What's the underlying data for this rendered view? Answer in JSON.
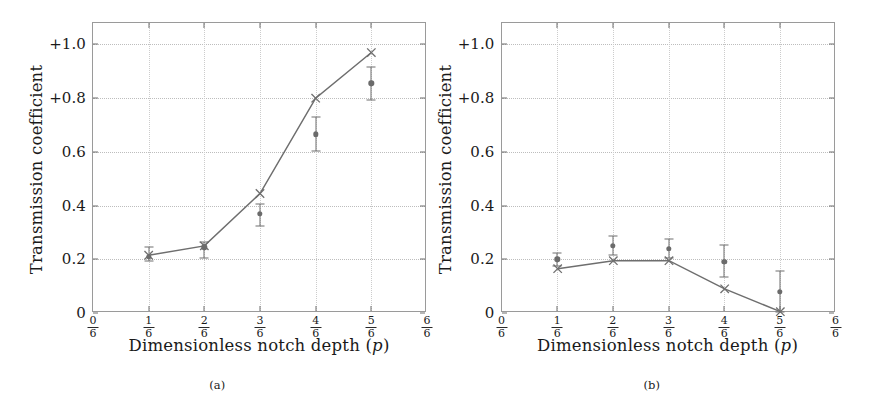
{
  "figure": {
    "panels": [
      {
        "caption": "(a)",
        "ylabel": "Transmission coefficient",
        "xlabel_text": "Dimensionless notch depth",
        "xlabel_symbol": "(p)",
        "yticks": [
          "0",
          "0.2",
          "0.4",
          "0.6",
          "+0.8",
          "+1.0"
        ],
        "ytick_values": [
          0,
          0.2,
          0.4,
          0.6,
          0.8,
          1.0
        ],
        "xticks": [
          {
            "num": "0",
            "den": "6"
          },
          {
            "num": "1",
            "den": "6"
          },
          {
            "num": "2",
            "den": "6"
          },
          {
            "num": "3",
            "den": "6"
          },
          {
            "num": "4",
            "den": "6"
          },
          {
            "num": "5",
            "den": "6"
          },
          {
            "num": "6",
            "den": "6"
          }
        ]
      },
      {
        "caption": "(b)",
        "ylabel": "Transmission coefficient",
        "xlabel_text": "Dimensionless notch depth",
        "xlabel_symbol": "(p)",
        "yticks": [
          "0",
          "0.2",
          "0.4",
          "0.6",
          "+0.8",
          "+1.0"
        ],
        "ytick_values": [
          0,
          0.2,
          0.4,
          0.6,
          0.8,
          1.0
        ],
        "xticks": [
          {
            "num": "0",
            "den": "6"
          },
          {
            "num": "1",
            "den": "6"
          },
          {
            "num": "2",
            "den": "6"
          },
          {
            "num": "3",
            "den": "6"
          },
          {
            "num": "4",
            "den": "6"
          },
          {
            "num": "5",
            "den": "6"
          },
          {
            "num": "6",
            "den": "6"
          }
        ]
      }
    ]
  },
  "style": {
    "line_color": "#6e6e6e",
    "marker_color": "#6b6b6b",
    "axis_color": "#9a9a9a",
    "grid_color": "#bdbdbd",
    "text_color": "#1a1a1a"
  },
  "chart_data": [
    {
      "type": "line",
      "panel": "(a)",
      "title": "",
      "xlabel": "Dimensionless notch depth (p)",
      "ylabel": "Transmission coefficient",
      "xlim": [
        0,
        1
      ],
      "ylim": [
        0,
        1.08
      ],
      "grid": true,
      "legend": "none",
      "xtick_labels": [
        "0/6",
        "1/6",
        "2/6",
        "3/6",
        "4/6",
        "5/6",
        "6/6"
      ],
      "xtick_values": [
        0,
        0.16667,
        0.33333,
        0.5,
        0.66667,
        0.83333,
        1
      ],
      "ytick_labels": [
        "0",
        "0.2",
        "0.4",
        "0.6",
        "+0.8",
        "+1.0"
      ],
      "ytick_values": [
        0,
        0.2,
        0.4,
        0.6,
        0.8,
        1.0
      ],
      "x": [
        0.16667,
        0.33333,
        0.5,
        0.66667,
        0.83333
      ],
      "series": [
        {
          "name": "theory",
          "marker": "x",
          "values": [
            0.215,
            0.25,
            0.445,
            0.8,
            0.97
          ]
        },
        {
          "name": "experiment",
          "marker": "dot",
          "values": [
            0.21,
            0.245,
            0.37,
            0.665,
            0.855
          ],
          "err_low": [
            0.195,
            0.205,
            0.325,
            0.605,
            0.795
          ],
          "err_high": [
            0.245,
            0.265,
            0.405,
            0.73,
            0.915
          ]
        }
      ]
    },
    {
      "type": "line",
      "panel": "(b)",
      "title": "",
      "xlabel": "Dimensionless notch depth (p)",
      "ylabel": "Transmission coefficient",
      "xlim": [
        0,
        1
      ],
      "ylim": [
        0,
        1.08
      ],
      "grid": true,
      "legend": "none",
      "xtick_labels": [
        "0/6",
        "1/6",
        "2/6",
        "3/6",
        "4/6",
        "5/6",
        "6/6"
      ],
      "xtick_values": [
        0,
        0.16667,
        0.33333,
        0.5,
        0.66667,
        0.83333,
        1
      ],
      "ytick_labels": [
        "0",
        "0.2",
        "0.4",
        "0.6",
        "+0.8",
        "+1.0"
      ],
      "ytick_values": [
        0,
        0.2,
        0.4,
        0.6,
        0.8,
        1.0
      ],
      "x": [
        0.16667,
        0.33333,
        0.5,
        0.66667,
        0.83333
      ],
      "series": [
        {
          "name": "theory",
          "marker": "x",
          "values": [
            0.165,
            0.195,
            0.195,
            0.09,
            0.005
          ]
        },
        {
          "name": "experiment",
          "marker": "dot",
          "values": [
            0.2,
            0.25,
            0.24,
            0.19,
            0.08
          ],
          "err_low": [
            0.175,
            0.215,
            0.205,
            0.135,
            0.005
          ],
          "err_high": [
            0.225,
            0.285,
            0.275,
            0.255,
            0.155
          ]
        }
      ]
    }
  ]
}
